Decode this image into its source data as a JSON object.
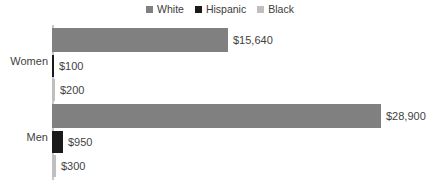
{
  "legend": {
    "position": "top-center",
    "items": [
      {
        "label": "White",
        "color": "#808080"
      },
      {
        "label": "Hispanic",
        "color": "#1a1a1a"
      },
      {
        "label": "Black",
        "color": "#bfbfbf"
      }
    ]
  },
  "axis": {
    "line_color": "#c8c8c8"
  },
  "groups": [
    {
      "name": "Women",
      "bars": [
        {
          "series": "White",
          "label": "$15,640",
          "value": 15640,
          "color": "#808080",
          "px_width": 176
        },
        {
          "series": "Hispanic",
          "label": "$100",
          "value": 100,
          "color": "#1a1a1a",
          "px_width": 2
        },
        {
          "series": "Black",
          "label": "$200",
          "value": 200,
          "color": "#bfbfbf",
          "px_width": 3
        }
      ]
    },
    {
      "name": "Men",
      "bars": [
        {
          "series": "White",
          "label": "$28,900",
          "value": 28900,
          "color": "#808080",
          "px_width": 329
        },
        {
          "series": "Hispanic",
          "label": "$950",
          "value": 950,
          "color": "#1a1a1a",
          "px_width": 11
        },
        {
          "series": "Black",
          "label": "$300",
          "value": 300,
          "color": "#bfbfbf",
          "px_width": 4
        }
      ]
    }
  ],
  "chart_data": {
    "type": "bar",
    "orientation": "horizontal",
    "title": "",
    "xlabel": "",
    "ylabel": "",
    "categories": [
      "Women",
      "Men"
    ],
    "series": [
      {
        "name": "White",
        "values": [
          15640,
          28900
        ],
        "labels": [
          "$15,640",
          "$28,900"
        ],
        "color": "#808080"
      },
      {
        "name": "Hispanic",
        "values": [
          100,
          950
        ],
        "labels": [
          "$100",
          "$950"
        ],
        "color": "#1a1a1a"
      },
      {
        "name": "Black",
        "values": [
          200,
          300
        ],
        "labels": [
          "$200",
          "$300"
        ],
        "color": "#bfbfbf"
      }
    ],
    "xlim": [
      0,
      28900
    ],
    "grid": false,
    "legend_position": "top-center",
    "data_labels": true
  }
}
